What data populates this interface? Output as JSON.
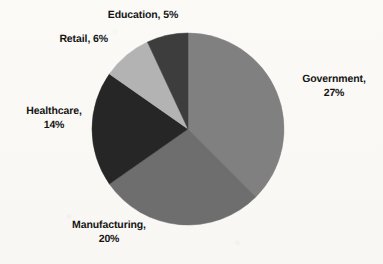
{
  "chart_data": {
    "type": "pie",
    "title": "",
    "subtitle": "",
    "xlabel": "",
    "ylabel": "",
    "legend_position": "none",
    "grid": false,
    "label_format": "{name}, {value}%",
    "start_angle_deg": 0,
    "direction": "clockwise",
    "categories": [
      "Government",
      "Manufacturing",
      "Healthcare",
      "Retail",
      "Education"
    ],
    "values": [
      27,
      20,
      14,
      6,
      5
    ],
    "slices": [
      {
        "name": "Government",
        "value": 27,
        "unit": "%",
        "color": "#808080",
        "label": "Government,\n27%"
      },
      {
        "name": "Manufacturing",
        "value": 20,
        "unit": "%",
        "color": "#6e6e6e",
        "label": "Manufacturing,\n20%"
      },
      {
        "name": "Healthcare",
        "value": 14,
        "unit": "%",
        "color": "#262626",
        "label": "Healthcare,\n14%"
      },
      {
        "name": "Retail",
        "value": 6,
        "unit": "%",
        "color": "#b3b3b3",
        "label": "Retail, 6%"
      },
      {
        "name": "Education",
        "value": 5,
        "unit": "%",
        "color": "#3d3d3d",
        "label": "Education, 5%"
      }
    ],
    "background_color": "#fbfaf7",
    "label_color": "#141414"
  }
}
